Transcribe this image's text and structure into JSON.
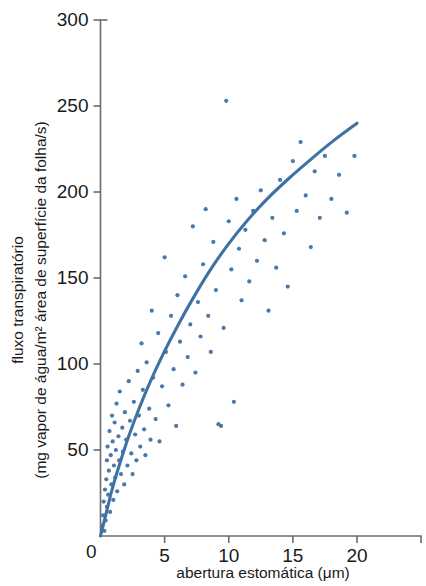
{
  "chart_data": {
    "type": "scatter",
    "title": "",
    "subtitle": "",
    "xlabel": "abertura estomática (μm)",
    "ylabel_line1": "fluxo transpiratório",
    "ylabel_line2": "(mg vapor de água/m² área de superfície da folha/s)",
    "xlim": [
      0,
      24
    ],
    "ylim": [
      0,
      300
    ],
    "xticks": [
      0,
      5,
      10,
      15,
      20
    ],
    "xtick_labels": [
      "0",
      "5",
      "10",
      "15",
      "20"
    ],
    "yticks": [
      0,
      50,
      100,
      150,
      200,
      250,
      300
    ],
    "ytick_labels": [
      "0",
      "50",
      "100",
      "150",
      "200",
      "250",
      "300"
    ],
    "grid": false,
    "legend": "none",
    "point_color": "#4a78a8",
    "curve_color": "#3f72a4",
    "axis_color": "#6b6b6b",
    "text_color": "#1a1a1a",
    "point_radius": 2.1,
    "series": [
      {
        "name": "observações",
        "marker": "circle",
        "points": [
          [
            0.15,
            6
          ],
          [
            0.2,
            12
          ],
          [
            0.25,
            20
          ],
          [
            0.3,
            3
          ],
          [
            0.35,
            27
          ],
          [
            0.4,
            9
          ],
          [
            0.45,
            33
          ],
          [
            0.5,
            17
          ],
          [
            0.5,
            44
          ],
          [
            0.55,
            52
          ],
          [
            0.6,
            24
          ],
          [
            0.65,
            38
          ],
          [
            0.7,
            61
          ],
          [
            0.75,
            14
          ],
          [
            0.8,
            47
          ],
          [
            0.85,
            30
          ],
          [
            0.9,
            70
          ],
          [
            0.95,
            55
          ],
          [
            1.0,
            21
          ],
          [
            1.05,
            41
          ],
          [
            1.1,
            66
          ],
          [
            1.15,
            34
          ],
          [
            1.2,
            50
          ],
          [
            1.25,
            77
          ],
          [
            1.3,
            26
          ],
          [
            1.4,
            58
          ],
          [
            1.45,
            44
          ],
          [
            1.5,
            84
          ],
          [
            1.6,
            36
          ],
          [
            1.7,
            63
          ],
          [
            1.75,
            49
          ],
          [
            1.85,
            30
          ],
          [
            1.9,
            72
          ],
          [
            2.0,
            56
          ],
          [
            2.1,
            41
          ],
          [
            2.2,
            90
          ],
          [
            2.3,
            67
          ],
          [
            2.4,
            48
          ],
          [
            2.5,
            36
          ],
          [
            2.6,
            78
          ],
          [
            2.7,
            59
          ],
          [
            2.8,
            44
          ],
          [
            2.9,
            96
          ],
          [
            3.0,
            70
          ],
          [
            3.1,
            52
          ],
          [
            3.2,
            112
          ],
          [
            3.3,
            85
          ],
          [
            3.4,
            62
          ],
          [
            3.5,
            47
          ],
          [
            3.6,
            101
          ],
          [
            3.8,
            74
          ],
          [
            3.9,
            56
          ],
          [
            4.0,
            131
          ],
          [
            4.1,
            92
          ],
          [
            4.3,
            68
          ],
          [
            4.5,
            118
          ],
          [
            4.6,
            55
          ],
          [
            4.8,
            87
          ],
          [
            5.0,
            162
          ],
          [
            5.1,
            107
          ],
          [
            5.3,
            76
          ],
          [
            5.5,
            128
          ],
          [
            5.7,
            97
          ],
          [
            5.9,
            64
          ],
          [
            6.0,
            140
          ],
          [
            6.2,
            113
          ],
          [
            6.4,
            88
          ],
          [
            6.6,
            151
          ],
          [
            6.8,
            104
          ],
          [
            7.0,
            123
          ],
          [
            7.2,
            180
          ],
          [
            7.4,
            95
          ],
          [
            7.6,
            136
          ],
          [
            7.8,
            116
          ],
          [
            8.0,
            158
          ],
          [
            8.2,
            190
          ],
          [
            8.4,
            128
          ],
          [
            8.6,
            107
          ],
          [
            8.8,
            171
          ],
          [
            9.0,
            143
          ],
          [
            9.2,
            65
          ],
          [
            9.4,
            64
          ],
          [
            9.6,
            121
          ],
          [
            9.8,
            253
          ],
          [
            10.0,
            183
          ],
          [
            10.2,
            155
          ],
          [
            10.4,
            78
          ],
          [
            10.6,
            196
          ],
          [
            10.8,
            167
          ],
          [
            11.0,
            137
          ],
          [
            11.3,
            178
          ],
          [
            11.6,
            148
          ],
          [
            11.9,
            189
          ],
          [
            12.2,
            160
          ],
          [
            12.5,
            201
          ],
          [
            12.8,
            172
          ],
          [
            13.1,
            131
          ],
          [
            13.4,
            185
          ],
          [
            13.7,
            156
          ],
          [
            14.0,
            207
          ],
          [
            14.3,
            176
          ],
          [
            14.6,
            145
          ],
          [
            15.0,
            218
          ],
          [
            15.3,
            189
          ],
          [
            15.6,
            229
          ],
          [
            16.0,
            198
          ],
          [
            16.4,
            168
          ],
          [
            16.7,
            212
          ],
          [
            17.1,
            185
          ],
          [
            17.5,
            221
          ],
          [
            18.0,
            196
          ],
          [
            18.6,
            210
          ],
          [
            19.2,
            188
          ],
          [
            19.8,
            221
          ]
        ]
      }
    ],
    "fit_curve": {
      "name": "curva ajustada",
      "description": "curva de saturação crescente",
      "points": [
        [
          0.0,
          0
        ],
        [
          0.4,
          12
        ],
        [
          0.9,
          27
        ],
        [
          1.5,
          42
        ],
        [
          2.2,
          58
        ],
        [
          3.0,
          74
        ],
        [
          3.9,
          90
        ],
        [
          4.9,
          106
        ],
        [
          6.0,
          122
        ],
        [
          7.2,
          138
        ],
        [
          8.5,
          154
        ],
        [
          9.9,
          169
        ],
        [
          11.4,
          183
        ],
        [
          13.0,
          196
        ],
        [
          14.7,
          208
        ],
        [
          16.4,
          219
        ],
        [
          18.2,
          230
        ],
        [
          20.0,
          240
        ]
      ]
    }
  }
}
